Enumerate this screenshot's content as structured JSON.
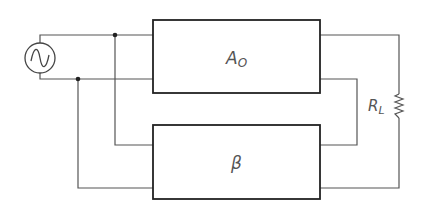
{
  "diagram": {
    "type": "feedback-amplifier-block-diagram",
    "blocks": [
      {
        "id": "amplifier",
        "label": "A",
        "subscript": "O"
      },
      {
        "id": "feedback",
        "label": "β"
      }
    ],
    "source": {
      "type": "ac-voltage-source",
      "icon": "sine-wave-icon"
    },
    "load": {
      "label": "R",
      "subscript": "L",
      "icon": "resistor-icon"
    },
    "colors": {
      "wire": "#555555",
      "box": "#222222",
      "label": "#555555"
    }
  }
}
